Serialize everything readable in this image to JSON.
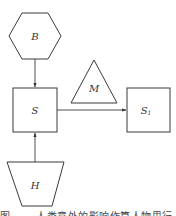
{
  "diagram": {
    "nodes": {
      "B": {
        "label": "B",
        "shape": "hexagon"
      },
      "S": {
        "label": "S",
        "shape": "square"
      },
      "S1": {
        "label": "S",
        "subscript": "1",
        "shape": "square"
      },
      "M": {
        "label": "M",
        "shape": "triangle"
      },
      "H": {
        "label": "H",
        "shape": "inverted-trapezoid"
      }
    },
    "edges": [
      {
        "from": "B",
        "to": "S",
        "direction": "down"
      },
      {
        "from": "H",
        "to": "S",
        "direction": "up"
      },
      {
        "from": "S",
        "to": "S1",
        "direction": "right"
      }
    ],
    "colors": {
      "stroke": "#3a3a3a",
      "text": "#333333",
      "background": "#ffffff"
    }
  },
  "caption": {
    "text": "图 . . .  人类意外的影响作算人物思行"
  }
}
